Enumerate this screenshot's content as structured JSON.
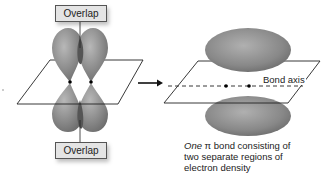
{
  "diagram": {
    "left_panel": {
      "top_label": "Overlap",
      "bottom_label": "Overlap",
      "orbitals": [
        "p-orbital-left",
        "p-orbital-right"
      ],
      "nuclei_count": 2
    },
    "arrow": "right-arrow",
    "right_panel": {
      "axis_label": "Bond axis",
      "caption_italic": "One",
      "caption_symbol": "π",
      "caption_rest_line1": " bond consisting of",
      "caption_line2": "two separate regions of",
      "caption_line3": "electron density"
    },
    "colors": {
      "lobe_fill": "#8a8a8a",
      "lobe_highlight": "#b5b5b5",
      "overlap_fill": "#555555",
      "plane_stroke": "#222222",
      "label_bg": "#e4e4e4",
      "text": "#222222"
    }
  }
}
